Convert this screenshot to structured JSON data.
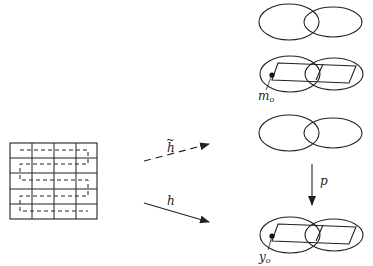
{
  "diagram": {
    "type": "mathematical-figure",
    "labels": {
      "h_tilde": "h",
      "h_tilde_accent": "~",
      "h": "h",
      "p": "p",
      "m0_main": "m",
      "m0_sub": "o",
      "y0_main": "y",
      "y0_sub": "o"
    },
    "grid": {
      "rows": 5,
      "cols": 4
    },
    "colors": {
      "stroke": "#222222",
      "background": "#ffffff"
    }
  }
}
